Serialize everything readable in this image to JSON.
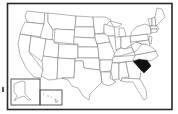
{
  "map": {
    "subject": "United States",
    "highlighted_state": "South Carolina",
    "highlight_color": "#111111",
    "state_fill": "#ffffff",
    "border_color": "#6a6a6a",
    "frame_color": "#2a2a2a",
    "insets": [
      "Alaska",
      "Hawaii"
    ]
  }
}
